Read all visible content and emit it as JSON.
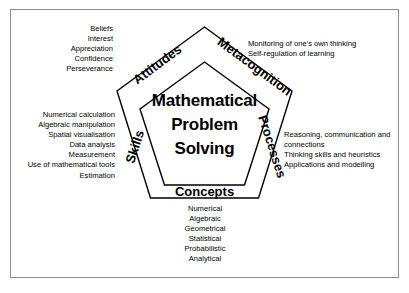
{
  "figure": {
    "border_color": "#8a8a8a",
    "line_color": "#000000",
    "background": "#ffffff"
  },
  "core": {
    "line1": "Mathematical",
    "line2": "Problem",
    "line3": "Solving"
  },
  "edges": {
    "attitudes": "Attitudes",
    "metacognition": "Metacognition",
    "processes": "Processes",
    "concepts": "Concepts",
    "skills": "Skills"
  },
  "lists": {
    "attitudes": {
      "align": "right",
      "items": [
        "Beliefs",
        "Interest",
        "Appreciation",
        "Confidence",
        "Perseverance"
      ]
    },
    "metacognition": {
      "align": "left",
      "items": [
        "Monitoring of one's own thinking",
        "Self-regulation of learning"
      ]
    },
    "skills": {
      "align": "right",
      "items": [
        "Numerical calculation",
        "Algebraic manipulation",
        "Spatial visualisation",
        "Data analysis",
        "Measurement",
        "Use of mathematical tools",
        "Estimation"
      ]
    },
    "processes": {
      "align": "left",
      "items": [
        "Reasoning, communication and connections",
        "Thinking skills and heuristics",
        "Applications and modelling"
      ]
    },
    "concepts": {
      "align": "center",
      "items": [
        "Numerical",
        "Algebraic",
        "Geometrical",
        "Statistical",
        "Probabilistic",
        "Analytical"
      ]
    }
  }
}
